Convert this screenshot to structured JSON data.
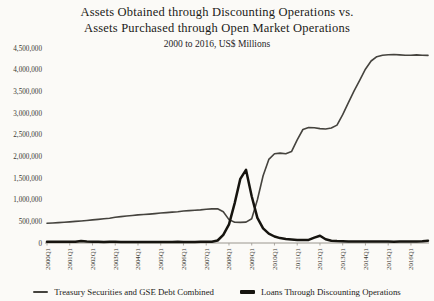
{
  "title": {
    "line1": "Assets Obtained through Discounting Operations vs.",
    "line2": "Assets Purchased through Open Market Operations",
    "subtitle": "2000 to 2016, US$ Millions"
  },
  "colors": {
    "background": "#fbfaf7",
    "axis": "#9a968e",
    "tick_text": "#3a3831",
    "title_text": "#1c1a17"
  },
  "chart_data": {
    "type": "line",
    "title": "Assets Obtained through Discounting Operations vs. Assets Purchased through Open Market Operations",
    "subtitle": "2000 to 2016, US$ Millions",
    "xlabel": "",
    "ylabel": "",
    "ylim": [
      0,
      4500000
    ],
    "grid": false,
    "legend_position": "bottom",
    "x_frequency": "quarterly",
    "x_start": "2000Q1",
    "x_end": "2016Q4",
    "x_tick_labels": [
      "2000Q1",
      "2001Q1",
      "2002Q1",
      "2003Q1",
      "2004Q1",
      "2005Q1",
      "2006Q1",
      "2007Q1",
      "2008Q1",
      "2009Q1",
      "2010Q1",
      "2011Q1",
      "2012Q1",
      "2013Q1",
      "2014Q1",
      "2015Q1",
      "2016Q1"
    ],
    "y_tick_labels": [
      "0",
      "500,000",
      "1,000,000",
      "1,500,000",
      "2,000,000",
      "2,500,000",
      "3,000,000",
      "3,500,000",
      "4,000,000",
      "4,500,000"
    ],
    "y_tick_values": [
      0,
      500000,
      1000000,
      1500000,
      2000000,
      2500000,
      3000000,
      3500000,
      4000000,
      4500000
    ],
    "series": [
      {
        "name": "Treasury Securities and GSE Debt Combined",
        "color": "#45433e",
        "stroke_width": 1.6,
        "values": [
          455000,
          462000,
          470000,
          478000,
          488000,
          498000,
          508000,
          520000,
          532000,
          545000,
          558000,
          570000,
          596000,
          610000,
          622000,
          635000,
          648000,
          658000,
          668000,
          678000,
          692000,
          702000,
          712000,
          722000,
          738000,
          748000,
          756000,
          764000,
          778000,
          788000,
          790000,
          720000,
          540000,
          478000,
          475000,
          482000,
          560000,
          1000000,
          1550000,
          1930000,
          2060000,
          2075000,
          2060000,
          2110000,
          2380000,
          2620000,
          2665000,
          2660000,
          2640000,
          2630000,
          2655000,
          2720000,
          2960000,
          3240000,
          3510000,
          3760000,
          4010000,
          4200000,
          4300000,
          4335000,
          4345000,
          4350000,
          4340000,
          4335000,
          4335000,
          4340000,
          4335000,
          4330000
        ]
      },
      {
        "name": "Loans Through Discounting Operations",
        "color": "#16140f",
        "stroke_width": 2.5,
        "values": [
          30000,
          28000,
          29000,
          31000,
          29000,
          27000,
          46000,
          34000,
          30000,
          27000,
          26000,
          27000,
          27000,
          26000,
          25000,
          26000,
          25000,
          24000,
          25000,
          26000,
          25000,
          24000,
          25000,
          27000,
          26000,
          25000,
          26000,
          27000,
          27000,
          29000,
          58000,
          190000,
          430000,
          920000,
          1480000,
          1690000,
          1080000,
          580000,
          340000,
          215000,
          150000,
          112000,
          92000,
          80000,
          72000,
          66000,
          72000,
          125000,
          168000,
          88000,
          54000,
          45000,
          40000,
          37000,
          35000,
          34000,
          33000,
          32000,
          32000,
          33000,
          32000,
          31000,
          32000,
          33000,
          34000,
          37000,
          41000,
          52000
        ]
      }
    ]
  },
  "legend": {
    "items": [
      {
        "label": "Treasury Securities and GSE Debt Combined"
      },
      {
        "label": "Loans Through Discounting Operations"
      }
    ]
  }
}
